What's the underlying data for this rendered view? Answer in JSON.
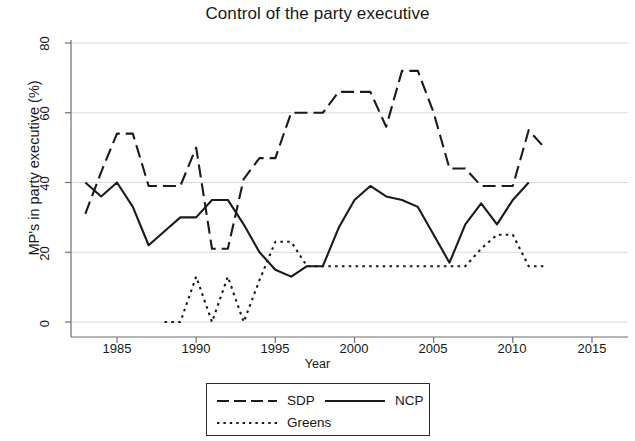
{
  "chart_data": {
    "type": "line",
    "title": "Control of the party executive",
    "xlabel": "Year",
    "ylabel": "MP's in party executive (%)",
    "xlim": [
      1982,
      2015
    ],
    "ylim": [
      0,
      80
    ],
    "xticks": [
      1985,
      1990,
      1995,
      2000,
      2005,
      2010,
      2015
    ],
    "yticks": [
      0,
      20,
      40,
      60,
      80
    ],
    "grid": "horizontal",
    "legend_position": "below-plot",
    "series": [
      {
        "name": "SDP",
        "style": "dashed",
        "color": "#1a1a1a",
        "x": [
          1983,
          1984,
          1985,
          1986,
          1987,
          1988,
          1989,
          1990,
          1991,
          1992,
          1993,
          1994,
          1995,
          1996,
          1997,
          1998,
          1999,
          2000,
          2001,
          2002,
          2003,
          2004,
          2005,
          2006,
          2007,
          2008,
          2009,
          2010,
          2011,
          2012
        ],
        "y": [
          31,
          43,
          54,
          54,
          39,
          39,
          39,
          50,
          21,
          21,
          41,
          47,
          47,
          60,
          60,
          60,
          66,
          66,
          66,
          56,
          72,
          72,
          60,
          44,
          44,
          39,
          39,
          39,
          55,
          50
        ]
      },
      {
        "name": "NCP",
        "style": "solid",
        "color": "#1a1a1a",
        "x": [
          1983,
          1984,
          1985,
          1986,
          1987,
          1988,
          1989,
          1990,
          1991,
          1992,
          1993,
          1994,
          1995,
          1996,
          1997,
          1998,
          1999,
          2000,
          2001,
          2002,
          2003,
          2004,
          2005,
          2006,
          2007,
          2008,
          2009,
          2010,
          2011
        ],
        "y": [
          40,
          36,
          40,
          33,
          22,
          26,
          30,
          30,
          35,
          35,
          28,
          20,
          15,
          13,
          16,
          16,
          27,
          35,
          39,
          36,
          35,
          33,
          25,
          17,
          28,
          34,
          28,
          35,
          40
        ]
      },
      {
        "name": "Greens",
        "style": "dotted",
        "color": "#1a1a1a",
        "x": [
          1988,
          1989,
          1990,
          1991,
          1992,
          1993,
          1994,
          1995,
          1996,
          1997,
          1998,
          1999,
          2000,
          2001,
          2002,
          2003,
          2004,
          2005,
          2006,
          2007,
          2008,
          2009,
          2010,
          2011,
          2012
        ],
        "y": [
          0,
          0,
          13,
          0,
          13,
          0,
          12,
          23,
          23,
          16,
          16,
          16,
          16,
          16,
          16,
          16,
          16,
          16,
          16,
          16,
          21,
          25,
          25,
          16,
          16
        ]
      }
    ]
  },
  "axes": {
    "y_tick_labels": [
      "0",
      "20",
      "40",
      "60",
      "80"
    ],
    "x_tick_labels": [
      "1985",
      "1990",
      "1995",
      "2000",
      "2005",
      "2010",
      "2015"
    ]
  },
  "legend": {
    "items": [
      {
        "label": "SDP",
        "style": "dashed"
      },
      {
        "label": "NCP",
        "style": "solid"
      },
      {
        "label": "Greens",
        "style": "dotted"
      }
    ]
  }
}
